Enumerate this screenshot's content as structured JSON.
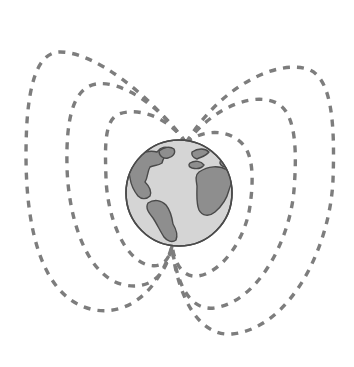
{
  "figure": {
    "width": 354,
    "height": 367,
    "background_color": "#ffffff"
  },
  "colors": {
    "background": "#ffffff",
    "field_line": "#7d7d7d",
    "globe_outline": "#4a4a4a",
    "globe_ocean": "#d5d5d5",
    "globe_land": "#8e8e8e",
    "land_outline": "#4a4a4a"
  },
  "globe": {
    "label": "Earth",
    "center_x": 179,
    "center_y": 193,
    "radius": 53,
    "ocean_fill": "#d5d5d5",
    "land_fill": "#8e8e8e",
    "outline_color": "#4a4a4a",
    "outline_width": 1.6,
    "landmasses": [
      {
        "name": "north-america",
        "fill": "#8e8e8e"
      },
      {
        "name": "greenland",
        "fill": "#8e8e8e"
      },
      {
        "name": "south-america",
        "fill": "#8e8e8e"
      },
      {
        "name": "europe",
        "fill": "#8e8e8e"
      },
      {
        "name": "africa",
        "fill": "#8e8e8e"
      },
      {
        "name": "west-africa-bulge",
        "fill": "#8e8e8e"
      }
    ]
  },
  "magnetic_poles": {
    "north": {
      "label": "north magnetic pole",
      "x": 186,
      "y": 143
    },
    "south": {
      "label": "south magnetic pole",
      "x": 172,
      "y": 246
    }
  },
  "field_lines": {
    "stroke_color": "#7d7d7d",
    "stroke_width": 3.4,
    "dash_pattern": "7 7",
    "count": 6,
    "side_left_count": 3,
    "side_right_count": 3,
    "lines": [
      {
        "name": "field-line-left-outer",
        "side": "left",
        "order": 3,
        "apex_x": 118,
        "apex_y": 33,
        "max_extent_x": 26,
        "bottom_y": 312,
        "path": "M 186 143 C 150 95, 95 52, 60 52 C 34 52, 26 95, 26 155 C 26 225, 40 300, 95 310 C 135 316, 162 282, 172 246"
      },
      {
        "name": "field-line-left-middle",
        "side": "left",
        "order": 2,
        "apex_x": 140,
        "apex_y": 76,
        "max_extent_x": 66,
        "bottom_y": 290,
        "path": "M 186 143 C 160 105, 120 80, 96 84 C 72 88, 66 122, 67 166 C 68 215, 85 276, 124 285 C 150 290, 166 276, 172 246"
      },
      {
        "name": "field-line-left-inner",
        "side": "left",
        "order": 1,
        "apex_x": 154,
        "apex_y": 111,
        "max_extent_x": 105,
        "bottom_y": 269,
        "path": "M 186 143 C 168 116, 137 107, 119 114 C 104 120, 105 147, 106 178 C 107 213, 122 258, 148 265 C 162 268, 169 261, 172 246"
      },
      {
        "name": "field-line-right-inner",
        "side": "right",
        "order": 1,
        "apex_x": 215,
        "apex_y": 128,
        "max_extent_x": 253,
        "bottom_y": 280,
        "path": "M 186 143 C 205 127, 233 130, 245 147 C 254 160, 253 185, 250 206 C 246 236, 224 272, 198 276 C 183 278, 175 264, 172 246"
      },
      {
        "name": "field-line-right-middle",
        "side": "right",
        "order": 2,
        "apex_x": 237,
        "apex_y": 94,
        "max_extent_x": 296,
        "bottom_y": 312,
        "path": "M 186 143 C 215 105, 258 90, 280 105 C 296 117, 297 152, 294 190 C 290 240, 258 302, 214 308 C 188 311, 176 280, 172 246"
      },
      {
        "name": "field-line-right-outer",
        "side": "right",
        "order": 3,
        "apex_x": 268,
        "apex_y": 63,
        "max_extent_x": 335,
        "bottom_y": 337,
        "path": "M 186 143 C 222 84, 280 58, 310 70 C 332 80, 335 125, 333 180 C 330 248, 290 328, 232 334 C 195 337, 176 288, 172 246"
      }
    ]
  }
}
